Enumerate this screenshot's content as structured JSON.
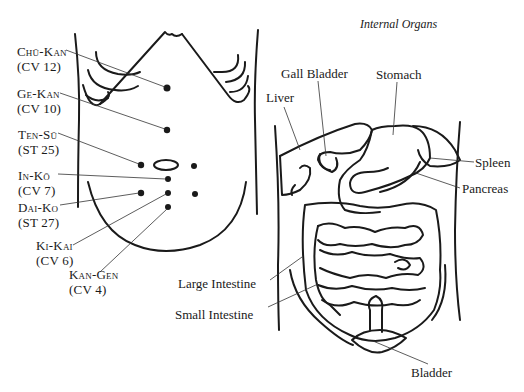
{
  "left_figure": {
    "points": [
      {
        "name": "Chū-Kan",
        "code": "(CV 12)"
      },
      {
        "name": "Ge-Kan",
        "code": "(CV 10)"
      },
      {
        "name": "Ten-Sū",
        "code": "(ST 25)"
      },
      {
        "name": "In-Kō",
        "code": "(CV 7)"
      },
      {
        "name": "Dai-Ko",
        "code": "(ST 27)"
      },
      {
        "name": "Ki-Kai",
        "code": "(CV 6)"
      },
      {
        "name": "Kan-Gen",
        "code": "(CV 4)"
      }
    ]
  },
  "right_figure": {
    "title": "Internal Organs",
    "organs": {
      "liver": "Liver",
      "gall_bladder": "Gall Bladder",
      "stomach": "Stomach",
      "spleen": "Spleen",
      "pancreas": "Pancreas",
      "large_intestine": "Large Intestine",
      "small_intestine": "Small Intestine",
      "bladder": "Bladder"
    }
  },
  "colors": {
    "ink": "#1a1a1a",
    "background": "#ffffff"
  }
}
